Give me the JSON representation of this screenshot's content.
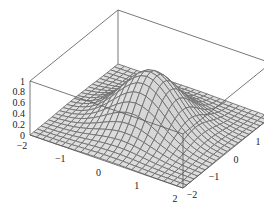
{
  "chart_data": {
    "type": "surface3d",
    "title": "",
    "function": "exp(-(x^2 + y^2))",
    "x_range": [
      -2,
      2
    ],
    "y_range": [
      -2,
      2
    ],
    "z_range": [
      0,
      1
    ],
    "mesh_divisions": 24,
    "x_ticks": [
      "-2",
      "-1",
      "0",
      "1",
      "2"
    ],
    "y_ticks": [
      "-2",
      "-1",
      "0",
      "1",
      "2"
    ],
    "z_ticks": [
      "0",
      "0.2",
      "0.4",
      "0.6",
      "0.8",
      "1"
    ],
    "xlabel": "",
    "ylabel": "",
    "zlabel": "",
    "boxed": true,
    "colors": {
      "surface": "#d9d9d9",
      "mesh": "#707070",
      "box": "#555555"
    }
  }
}
